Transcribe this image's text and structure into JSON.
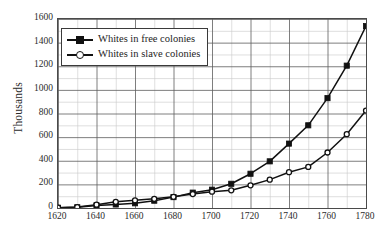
{
  "chart_data": {
    "type": "line",
    "title": "",
    "xlabel": "",
    "ylabel": "Thousands",
    "xlim": [
      1620,
      1780
    ],
    "ylim": [
      0,
      1600
    ],
    "grid": true,
    "legend_position": "upper left",
    "x_major_step": 20,
    "x_minor_step": 10,
    "y_major_step": 200,
    "y_minor_step": 100,
    "xticks": [
      "1620",
      "1640",
      "1660",
      "1680",
      "1700",
      "1720",
      "1740",
      "1760",
      "1780"
    ],
    "yticks": [
      "0",
      "200",
      "400",
      "600",
      "800",
      "1000",
      "1200",
      "1400",
      "1600"
    ],
    "x": [
      1620,
      1630,
      1640,
      1650,
      1660,
      1670,
      1680,
      1690,
      1700,
      1710,
      1720,
      1730,
      1740,
      1750,
      1760,
      1770,
      1780
    ],
    "series": [
      {
        "name": "Whites in free colonies",
        "marker": "filled-square",
        "color": "#111111",
        "values": [
          2,
          6,
          22,
          30,
          40,
          62,
          92,
          130,
          155,
          205,
          290,
          395,
          545,
          700,
          930,
          1205,
          1540
        ]
      },
      {
        "name": "Whites in slave colonies",
        "marker": "open-circle",
        "color": "#111111",
        "values": [
          3,
          8,
          28,
          52,
          65,
          78,
          95,
          118,
          138,
          150,
          192,
          240,
          303,
          348,
          470,
          625,
          825
        ]
      }
    ]
  },
  "axes": {
    "ylabel_text": "Thousands"
  },
  "legend": {
    "items": [
      {
        "label": "Whites in free colonies"
      },
      {
        "label": "Whites in slave colonies"
      }
    ]
  }
}
